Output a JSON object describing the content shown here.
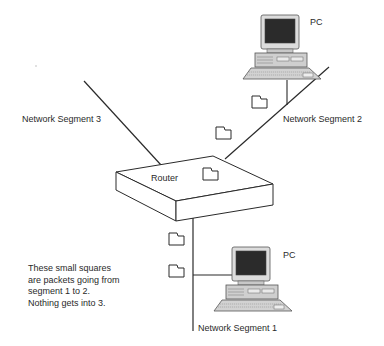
{
  "diagram": {
    "title": "",
    "nodes": {
      "router": {
        "label": "Router"
      },
      "pc_top": {
        "label": "PC"
      },
      "pc_bottom": {
        "label": "PC"
      }
    },
    "segments": {
      "segment1": {
        "label": "Network Segment 1"
      },
      "segment2": {
        "label": "Network Segment 2"
      },
      "segment3": {
        "label": "Network Segment 3"
      }
    },
    "packets": [
      {
        "segment": "segment2",
        "position": "near top PC"
      },
      {
        "segment": "segment2",
        "position": "mid"
      },
      {
        "segment": "router",
        "position": "on router top"
      },
      {
        "segment": "segment1",
        "position": "below router"
      },
      {
        "segment": "segment1",
        "position": "near bottom PC"
      }
    ],
    "note": {
      "lines": [
        "These small squares",
        "are packets going from",
        "segment 1 to 2.",
        "Nothing gets into 3."
      ]
    },
    "colors": {
      "line": "#2a2a2a",
      "monitor_screen": "#2b2b2b",
      "pc_body": "#cfcfcf"
    }
  }
}
